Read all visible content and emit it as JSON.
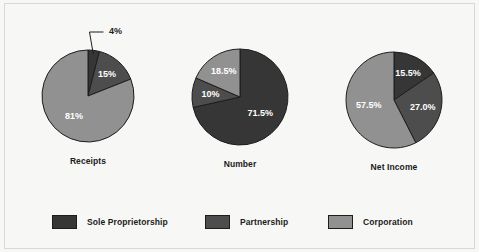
{
  "chart_data": {
    "type": "pie",
    "title": "",
    "legend_position": "bottom",
    "categories": [
      "Sole Proprietorship",
      "Partnership",
      "Corporation"
    ],
    "colors": {
      "sole_proprietorship": "#363636",
      "partnership": "#4d4d4d",
      "corporation": "#919191",
      "outline": "#1d1d1d",
      "background": "#f7f7f5",
      "label_light": "#ffffff",
      "label_dark": "#1d1d1d"
    },
    "charts": [
      {
        "title": "Receipts",
        "center": [
          88,
          96
        ],
        "radius": 46,
        "slices": [
          {
            "category": "Sole Proprietorship",
            "value": 4,
            "label": "4%",
            "label_outside": true
          },
          {
            "category": "Partnership",
            "value": 15,
            "label": "15%",
            "label_outside": false
          },
          {
            "category": "Corporation",
            "value": 81,
            "label": "81%",
            "label_outside": false
          }
        ]
      },
      {
        "title": "Number",
        "center": [
          240,
          97
        ],
        "radius": 48,
        "slices": [
          {
            "category": "Sole Proprietorship",
            "value": 71.5,
            "label": "71.5%",
            "label_outside": false
          },
          {
            "category": "Partnership",
            "value": 10,
            "label": "10%",
            "label_outside": false
          },
          {
            "category": "Corporation",
            "value": 18.5,
            "label": "18.5%",
            "label_outside": false
          }
        ]
      },
      {
        "title": "Net Income",
        "center": [
          394,
          100
        ],
        "radius": 48,
        "slices": [
          {
            "category": "Sole Proprietorship",
            "value": 15.5,
            "label": "15.5%",
            "label_outside": false
          },
          {
            "category": "Partnership",
            "value": 27.0,
            "label": "27.0%",
            "label_outside": false
          },
          {
            "category": "Corporation",
            "value": 57.5,
            "label": "57.5%",
            "label_outside": false
          }
        ]
      }
    ]
  },
  "legend": {
    "items": [
      {
        "label": "Sole Proprietorship",
        "color": "#363636",
        "x": 52
      },
      {
        "label": "Partnership",
        "color": "#4d4d4d",
        "x": 205
      },
      {
        "label": "Corporation",
        "color": "#919191",
        "x": 328
      }
    ]
  }
}
